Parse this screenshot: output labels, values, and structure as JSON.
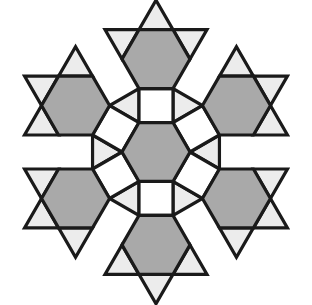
{
  "figure": {
    "canvas": {
      "width": 312,
      "height": 305,
      "background": "#ffffff"
    }
  },
  "palette": {
    "hexagon_fill": "#a9a9a9",
    "square_fill": "#ffffff",
    "triangle_fill": "#ececec",
    "outline": "#1a1a1a",
    "outline_width": 3.2
  },
  "legend": {
    "hexagon_label": "hexagon",
    "square_label": "square",
    "triangle_label": "triangle"
  },
  "chart_data": {
    "type": "diagram",
    "shape_counts": {
      "hexagons": 7,
      "squares": 6,
      "triangles": 12
    },
    "geometry": {
      "center": [
        156,
        152
      ],
      "hexagon_circumradius": 34,
      "ring_radius": 68,
      "hexagon_centers": [
        [
          156,
          152
        ],
        [
          156,
          84
        ],
        [
          156,
          220
        ],
        [
          97,
          118
        ],
        [
          97,
          186
        ],
        [
          215,
          118
        ],
        [
          215,
          186
        ]
      ],
      "square_centers": [
        [
          156,
          118
        ],
        [
          156,
          186
        ],
        [
          68,
          152
        ],
        [
          244,
          152
        ],
        [
          107,
          84
        ],
        [
          107,
          220
        ]
      ]
    },
    "shapes": {
      "hexagons": [
        {
          "name": "center-hexagon",
          "points": "156,118 185.4,135 185.4,169 156,186 126.6,169 126.6,135"
        },
        {
          "name": "top-hexagon",
          "points": "156,50 185.4,67 185.4,101 156,118 126.6,101 126.6,67"
        },
        {
          "name": "bottom-hexagon",
          "points": "156,186 185.4,203 185.4,237 156,254 126.6,237 126.6,203"
        },
        {
          "name": "upper-left-hexagon",
          "points": "97,84 126.6,101 126.6,135 97,152 67.4,135 67.4,101"
        },
        {
          "name": "lower-left-hexagon",
          "points": "97,152 126.6,169 126.6,203 97,220 67.4,203 67.4,169"
        },
        {
          "name": "upper-right-hexagon",
          "points": "215,84 244.6,101 244.6,135 215,152 185.4,135 185.4,101"
        },
        {
          "name": "lower-right-hexagon",
          "points": "215,152 244.6,169 244.6,203 215,220 185.4,203 185.4,169"
        }
      ],
      "squares": [
        {
          "name": "top-center-square",
          "points": "126.6,101 185.4,101 185.4,135 126.6,135"
        },
        {
          "name": "bottom-center-square",
          "points": "126.6,169 185.4,169 185.4,203 126.6,203"
        },
        {
          "name": "left-square",
          "points": "67.4,135 67.4,101 38,118 38,152"
        },
        {
          "name": "right-square",
          "points": "244.6,135 244.6,101 274,118 274,152"
        },
        {
          "name": "upper-left-square",
          "points": "126.6,101 97,84 126.6,67 156,50"
        },
        {
          "name": "upper-right-square",
          "points": "185.4,101 215,84 185.4,67 156,50"
        }
      ],
      "triangles": [
        {
          "name": "inner-triangle-upper-left",
          "points": "126.6,101 126.6,135 97,118"
        },
        {
          "name": "inner-triangle-upper-right",
          "points": "185.4,101 185.4,135 215,118"
        },
        {
          "name": "inner-triangle-lower-left",
          "points": "126.6,169 126.6,203 97,186"
        },
        {
          "name": "inner-triangle-lower-right",
          "points": "185.4,169 185.4,203 215,186"
        },
        {
          "name": "outer-triangle-left",
          "points": "38,118 38,152 20,135"
        },
        {
          "name": "outer-triangle-right",
          "points": "274,118 274,152 292,135"
        },
        {
          "name": "outer-triangle-top-left",
          "points": "126.6,67 97,84 97,50"
        },
        {
          "name": "outer-triangle-top-right",
          "points": "185.4,67 215,84 215,50"
        },
        {
          "name": "outer-triangle-bottom-left",
          "points": "126.6,237 97,220 97,254"
        },
        {
          "name": "outer-triangle-bottom-right",
          "points": "185.4,237 215,220 215,254"
        }
      ]
    }
  }
}
